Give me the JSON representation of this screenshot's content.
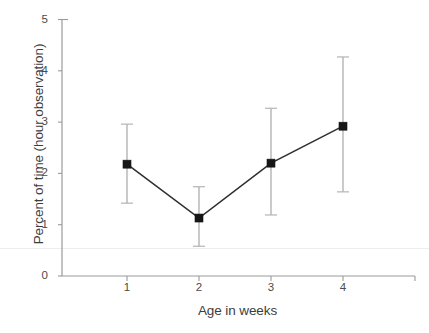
{
  "chart_data": {
    "type": "line",
    "title": "",
    "subtitle": "",
    "xlabel": "Age in weeks",
    "ylabel": "Percent of time (hour observation)",
    "x": [
      1,
      2,
      3,
      4
    ],
    "categories": [
      "1",
      "2",
      "3",
      "4"
    ],
    "xtick_labels": [
      "1",
      "2",
      "3",
      "4"
    ],
    "ytick_labels": [
      "0",
      "1",
      "2",
      "3",
      "4",
      "5"
    ],
    "yticks": [
      0,
      1,
      2,
      3,
      4,
      5
    ],
    "xlim": [
      0.45,
      4.95
    ],
    "ylim": [
      0,
      5
    ],
    "grid": false,
    "legend": false,
    "legend_position": "none",
    "marker": "filled-square",
    "error_bars": "vertical",
    "series": [
      {
        "name": "Percent of time",
        "values": [
          2.18,
          1.13,
          2.2,
          2.92
        ],
        "err_low": [
          1.42,
          0.58,
          1.19,
          1.64
        ],
        "err_high": [
          2.96,
          1.74,
          3.27,
          4.27
        ]
      }
    ],
    "points": [
      {
        "x": 1,
        "y": 2.18,
        "low": 1.42,
        "high": 2.96
      },
      {
        "x": 2,
        "y": 1.13,
        "low": 0.58,
        "high": 1.74
      },
      {
        "x": 3,
        "y": 2.2,
        "low": 1.19,
        "high": 3.27
      },
      {
        "x": 4,
        "y": 2.92,
        "low": 1.64,
        "high": 4.27
      }
    ],
    "colors": {
      "marker": "#161616",
      "line": "#2e2e2e",
      "error_bar": "#b4b4b4",
      "axis": "#9a9a9a",
      "text": "#3d3d3d",
      "background": "#ffffff"
    }
  }
}
